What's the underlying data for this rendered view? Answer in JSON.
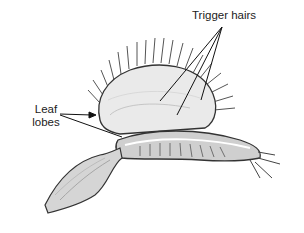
{
  "diagram": {
    "labels": {
      "trigger_hairs": "Trigger hairs",
      "leaf_line1": "Leaf",
      "leaf_line2": "lobes"
    },
    "colors": {
      "background": "#ffffff",
      "ink": "#222222",
      "shade": "#9a9a9a",
      "light_shade": "#d8d8d8"
    }
  }
}
